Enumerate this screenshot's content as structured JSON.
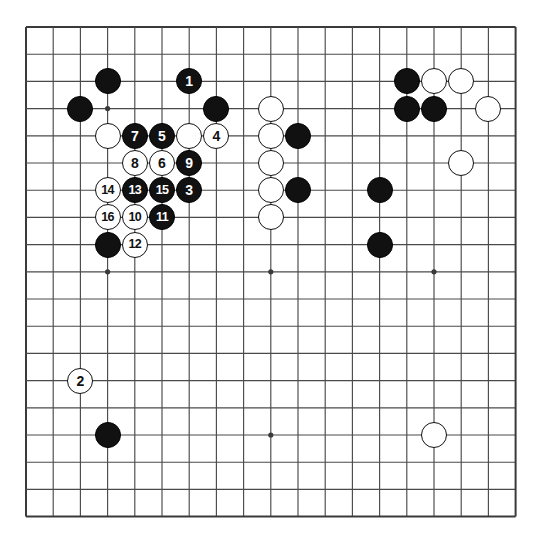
{
  "app": {
    "title": "Go board diagram",
    "type": "go-game-diagram"
  },
  "board": {
    "size": 19,
    "origin_x": 26,
    "origin_y": 27,
    "spacing": 27.2,
    "line_color": "#4a4a4a",
    "border_color": "#3a3a3a",
    "background_color": "#ffffff",
    "stone_radius": 13,
    "star_points": [
      {
        "col": 4,
        "row": 4
      },
      {
        "col": 10,
        "row": 4
      },
      {
        "col": 16,
        "row": 4
      },
      {
        "col": 4,
        "row": 10
      },
      {
        "col": 10,
        "row": 10
      },
      {
        "col": 16,
        "row": 10
      },
      {
        "col": 4,
        "row": 16
      },
      {
        "col": 10,
        "row": 16
      },
      {
        "col": 16,
        "row": 16
      }
    ],
    "colors": {
      "black_stone": "#111111",
      "white_stone": "#ffffff",
      "black_label": "#ffffff",
      "white_label": "#111111"
    }
  },
  "stones": [
    {
      "col": 4,
      "row": 3,
      "color": "black",
      "label": ""
    },
    {
      "col": 7,
      "row": 3,
      "color": "black",
      "label": "1"
    },
    {
      "col": 15,
      "row": 3,
      "color": "black",
      "label": ""
    },
    {
      "col": 16,
      "row": 3,
      "color": "white",
      "label": ""
    },
    {
      "col": 17,
      "row": 3,
      "color": "white",
      "label": ""
    },
    {
      "col": 3,
      "row": 4,
      "color": "black",
      "label": ""
    },
    {
      "col": 8,
      "row": 4,
      "color": "black",
      "label": ""
    },
    {
      "col": 10,
      "row": 4,
      "color": "white",
      "label": ""
    },
    {
      "col": 15,
      "row": 4,
      "color": "black",
      "label": ""
    },
    {
      "col": 16,
      "row": 4,
      "color": "black",
      "label": ""
    },
    {
      "col": 18,
      "row": 4,
      "color": "white",
      "label": ""
    },
    {
      "col": 4,
      "row": 5,
      "color": "white",
      "label": ""
    },
    {
      "col": 5,
      "row": 5,
      "color": "black",
      "label": "7"
    },
    {
      "col": 6,
      "row": 5,
      "color": "black",
      "label": "5"
    },
    {
      "col": 7,
      "row": 5,
      "color": "white",
      "label": ""
    },
    {
      "col": 8,
      "row": 5,
      "color": "white",
      "label": "4"
    },
    {
      "col": 10,
      "row": 5,
      "color": "white",
      "label": ""
    },
    {
      "col": 11,
      "row": 5,
      "color": "black",
      "label": ""
    },
    {
      "col": 5,
      "row": 6,
      "color": "white",
      "label": "8"
    },
    {
      "col": 6,
      "row": 6,
      "color": "white",
      "label": "6"
    },
    {
      "col": 7,
      "row": 6,
      "color": "black",
      "label": "9"
    },
    {
      "col": 10,
      "row": 6,
      "color": "white",
      "label": ""
    },
    {
      "col": 17,
      "row": 6,
      "color": "white",
      "label": ""
    },
    {
      "col": 4,
      "row": 7,
      "color": "white",
      "label": "14"
    },
    {
      "col": 5,
      "row": 7,
      "color": "black",
      "label": "13"
    },
    {
      "col": 6,
      "row": 7,
      "color": "black",
      "label": "15"
    },
    {
      "col": 7,
      "row": 7,
      "color": "black",
      "label": "3"
    },
    {
      "col": 10,
      "row": 7,
      "color": "white",
      "label": ""
    },
    {
      "col": 11,
      "row": 7,
      "color": "black",
      "label": ""
    },
    {
      "col": 14,
      "row": 7,
      "color": "black",
      "label": ""
    },
    {
      "col": 4,
      "row": 8,
      "color": "white",
      "label": "16"
    },
    {
      "col": 5,
      "row": 8,
      "color": "white",
      "label": "10"
    },
    {
      "col": 6,
      "row": 8,
      "color": "black",
      "label": "11"
    },
    {
      "col": 10,
      "row": 8,
      "color": "white",
      "label": ""
    },
    {
      "col": 4,
      "row": 9,
      "color": "black",
      "label": ""
    },
    {
      "col": 5,
      "row": 9,
      "color": "white",
      "label": "12"
    },
    {
      "col": 14,
      "row": 9,
      "color": "black",
      "label": ""
    },
    {
      "col": 3,
      "row": 14,
      "color": "white",
      "label": "2"
    },
    {
      "col": 4,
      "row": 16,
      "color": "black",
      "label": ""
    },
    {
      "col": 16,
      "row": 16,
      "color": "white",
      "label": ""
    }
  ]
}
